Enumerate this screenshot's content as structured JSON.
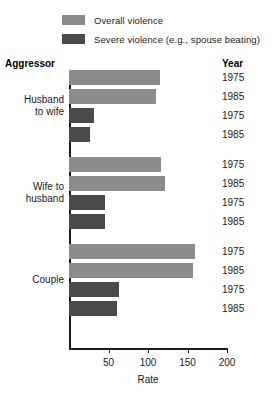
{
  "chart_data": {
    "type": "bar",
    "orientation": "horizontal",
    "title": "",
    "xlabel": "Rate",
    "ylabel": "",
    "xlim": [
      0,
      200
    ],
    "xticks": [
      50,
      100,
      150,
      200
    ],
    "xtick_labels": [
      "50",
      "100",
      "150",
      "200"
    ],
    "grid": false,
    "legend_position": "top",
    "column_headers": {
      "category": "Aggressor",
      "year": "Year"
    },
    "series": [
      {
        "name": "Overall violence",
        "color": "#8c8c8c"
      },
      {
        "name": "Severe violence (e.g., spouse beating)",
        "color": "#4a4a4a"
      }
    ],
    "groups": [
      {
        "category": "Husband\nto wife",
        "bars": [
          {
            "year": "1975",
            "series": "Overall violence",
            "value": 115
          },
          {
            "year": "1985",
            "series": "Overall violence",
            "value": 110
          },
          {
            "year": "1975",
            "series": "Severe violence (e.g., spouse beating)",
            "value": 32
          },
          {
            "year": "1985",
            "series": "Severe violence (e.g., spouse beating)",
            "value": 27
          }
        ]
      },
      {
        "category": "Wife to\nhusband",
        "bars": [
          {
            "year": "1975",
            "series": "Overall violence",
            "value": 116
          },
          {
            "year": "1985",
            "series": "Overall violence",
            "value": 121
          },
          {
            "year": "1975",
            "series": "Severe violence (e.g., spouse beating)",
            "value": 46
          },
          {
            "year": "1985",
            "series": "Severe violence (e.g., spouse beating)",
            "value": 46
          }
        ]
      },
      {
        "category": "Couple",
        "bars": [
          {
            "year": "1975",
            "series": "Overall violence",
            "value": 160
          },
          {
            "year": "1985",
            "series": "Overall violence",
            "value": 157
          },
          {
            "year": "1975",
            "series": "Severe violence (e.g., spouse beating)",
            "value": 63
          },
          {
            "year": "1985",
            "series": "Severe violence (e.g., spouse beating)",
            "value": 61
          }
        ]
      }
    ]
  }
}
